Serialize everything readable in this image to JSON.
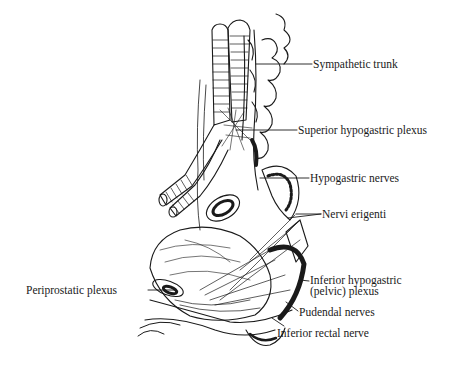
{
  "diagram": {
    "type": "anatomical line illustration",
    "stroke_color": "#1a1a1a",
    "background": "#ffffff"
  },
  "labels": [
    {
      "id": "sympathetic-trunk",
      "text": "Sympathetic trunk",
      "x": 313,
      "y": 60
    },
    {
      "id": "superior-hypogastric-plexus",
      "text": "Superior hypogastric plexus",
      "x": 298,
      "y": 124
    },
    {
      "id": "hypogastric-nerves",
      "text": "Hypogastric nerves",
      "x": 310,
      "y": 172
    },
    {
      "id": "nervi-erigenti",
      "text": "Nervi erigenti",
      "x": 322,
      "y": 210
    },
    {
      "id": "periprostatic-plexus",
      "text": "Periprostatic plexus",
      "x": 26,
      "y": 284
    },
    {
      "id": "inferior-hypogastric-plexus",
      "line1": "Inferior hypogastric",
      "line2": "(pelvic) plexus",
      "x": 310,
      "y": 275
    },
    {
      "id": "pudendal-nerves",
      "text": "Pudendal nerves",
      "x": 299,
      "y": 306
    },
    {
      "id": "inferior-rectal-nerve",
      "text": "Inferior rectal nerve",
      "x": 277,
      "y": 327
    }
  ]
}
